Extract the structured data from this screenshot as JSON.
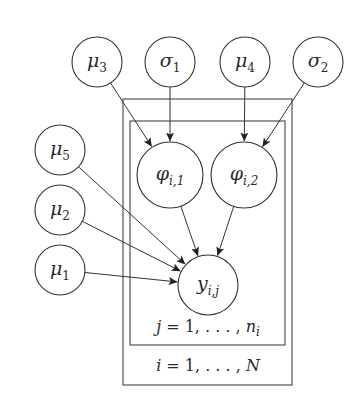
{
  "diagram": {
    "type": "plate-notation graphical model",
    "nodes": [
      {
        "id": "mu3",
        "symbol": "μ",
        "sub": "3",
        "cx": 97,
        "cy": 62,
        "r": 25
      },
      {
        "id": "sigma1",
        "symbol": "σ",
        "sub": "1",
        "cx": 170,
        "cy": 62,
        "r": 25
      },
      {
        "id": "mu4",
        "symbol": "μ",
        "sub": "4",
        "cx": 245,
        "cy": 62,
        "r": 25
      },
      {
        "id": "sigma2",
        "symbol": "σ",
        "sub": "2",
        "cx": 318,
        "cy": 62,
        "r": 25
      },
      {
        "id": "phi_i1",
        "symbol": "φ",
        "sub": "i,1",
        "cx": 170,
        "cy": 175,
        "r": 33
      },
      {
        "id": "phi_i2",
        "symbol": "φ",
        "sub": "i,2",
        "cx": 244,
        "cy": 175,
        "r": 33
      },
      {
        "id": "mu5",
        "symbol": "μ",
        "sub": "5",
        "cx": 60,
        "cy": 150,
        "r": 25
      },
      {
        "id": "mu2",
        "symbol": "μ",
        "sub": "2",
        "cx": 60,
        "cy": 210,
        "r": 25
      },
      {
        "id": "mu1",
        "symbol": "μ",
        "sub": "1",
        "cx": 60,
        "cy": 270,
        "r": 25
      },
      {
        "id": "y_ij",
        "symbol": "y",
        "sub": "i,j",
        "cx": 208,
        "cy": 285,
        "r": 30
      }
    ],
    "edges": [
      {
        "from": "mu3",
        "to": "phi_i1"
      },
      {
        "from": "sigma1",
        "to": "phi_i1"
      },
      {
        "from": "mu4",
        "to": "phi_i2"
      },
      {
        "from": "sigma2",
        "to": "phi_i2"
      },
      {
        "from": "phi_i1",
        "to": "y_ij"
      },
      {
        "from": "phi_i2",
        "to": "y_ij"
      },
      {
        "from": "mu5",
        "to": "y_ij"
      },
      {
        "from": "mu2",
        "to": "y_ij"
      },
      {
        "from": "mu1",
        "to": "y_ij"
      }
    ],
    "plates": [
      {
        "id": "outer",
        "label": "i = 1, . . . , N",
        "index": "i",
        "range_end": "N",
        "x": 123,
        "y": 99,
        "w": 169,
        "h": 286
      },
      {
        "id": "inner",
        "label": "j = 1, . . . , n_i",
        "index": "j",
        "range_end": "n_i",
        "x": 130,
        "y": 121,
        "w": 155,
        "h": 224
      }
    ],
    "plate_labels": {
      "inner_text": "j = 1, . . . , n",
      "inner_sub": "i",
      "outer_text": "i = 1, . . . , N"
    }
  }
}
